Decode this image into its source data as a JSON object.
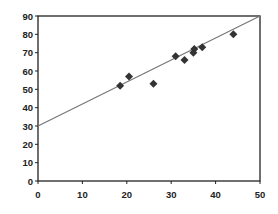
{
  "chart_data": {
    "type": "scatter",
    "title": "",
    "xlabel": "",
    "ylabel": "",
    "xlim": [
      0,
      50
    ],
    "ylim": [
      0,
      90
    ],
    "x_ticks": [
      0,
      10,
      20,
      30,
      40,
      50
    ],
    "y_ticks": [
      0,
      10,
      20,
      30,
      40,
      50,
      60,
      70,
      80,
      90
    ],
    "grid": false,
    "legend": null,
    "series": [
      {
        "name": "data",
        "marker": "diamond",
        "color": "#333333",
        "points": [
          {
            "x": 18.5,
            "y": 52
          },
          {
            "x": 20.5,
            "y": 57
          },
          {
            "x": 26,
            "y": 53
          },
          {
            "x": 31,
            "y": 68
          },
          {
            "x": 33,
            "y": 66
          },
          {
            "x": 35,
            "y": 70
          },
          {
            "x": 35.2,
            "y": 72
          },
          {
            "x": 37,
            "y": 73
          },
          {
            "x": 44,
            "y": 80
          }
        ]
      }
    ],
    "trendline": {
      "name": "fit",
      "color": "#777777",
      "x": [
        0,
        50
      ],
      "y": [
        30,
        90
      ]
    }
  }
}
